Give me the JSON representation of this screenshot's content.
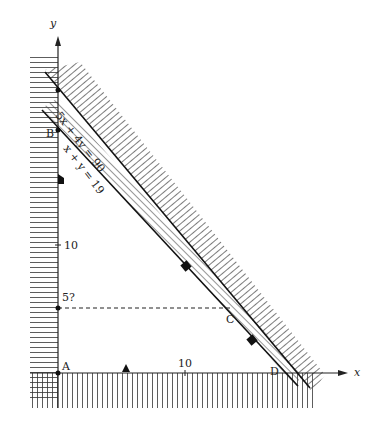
{
  "diagram": {
    "axes": {
      "x_label": "x",
      "y_label": "y"
    },
    "ticks": {
      "x_ten": "10",
      "y_ten": "10"
    },
    "points": {
      "A": "A",
      "B": "B",
      "C": "C",
      "D": "D"
    },
    "y_marker": "5?",
    "constraints": [
      {
        "label": "5x + 4y = 90"
      },
      {
        "label": "x + y = 19"
      }
    ],
    "colors": {
      "ink": "#222222",
      "background": "#ffffff"
    }
  }
}
